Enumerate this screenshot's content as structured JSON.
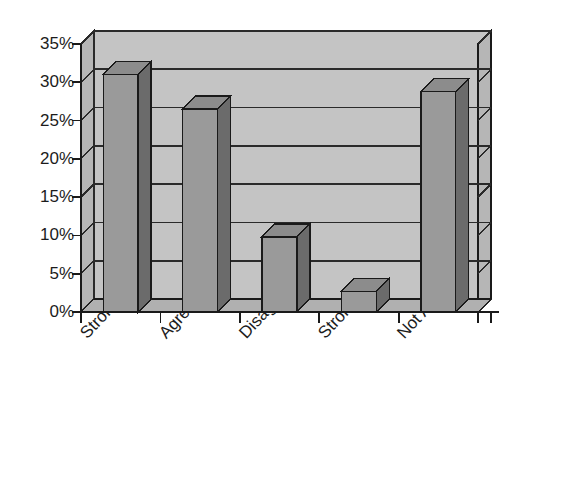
{
  "chart_data": {
    "type": "bar",
    "title": "",
    "subtitle": "",
    "xlabel": "",
    "ylabel": "",
    "categories": [
      "Strongly Agree",
      "Agree",
      "Disagree",
      "Strongly Disagree",
      "Not Applicable"
    ],
    "values": [
      31,
      26.5,
      9.8,
      2.7,
      28.8
    ],
    "series": [
      {
        "name": "Series 1",
        "values": [
          31,
          26.5,
          9.8,
          2.7,
          28.8
        ]
      }
    ],
    "ylim": [
      0,
      35
    ],
    "ytick_values": [
      0,
      5,
      10,
      15,
      20,
      25,
      30,
      35
    ],
    "ytick_labels": [
      "0%",
      "5%",
      "10%",
      "15%",
      "20%",
      "25%",
      "30%",
      "35%"
    ],
    "xtick_labels": [
      "Strongly Agree",
      "Agree",
      "Disagree",
      "Strongly Disagree",
      "Not Applicable"
    ],
    "grid": true,
    "grid_axis": "y",
    "legend": false,
    "legend_position": "none",
    "annotations": [],
    "style": "3d-column-grayscale",
    "value_format": "percent"
  },
  "colors": {
    "background": "#ffffff",
    "wall_back": "#c4c4c4",
    "wall_side": "#b6b6b6",
    "floor_top": "#b0b0b0",
    "floor_front": "#9d9d9d",
    "bar_front": "#9a9a9a",
    "bar_side": "#6b6b6b",
    "bar_top": "#8c8c8c",
    "gridline": "#2a2a2a",
    "outline": "#1a1a1a",
    "text": "#1c1c1c"
  },
  "axis": {
    "ytick_count": 8,
    "xtick_count": 6
  }
}
